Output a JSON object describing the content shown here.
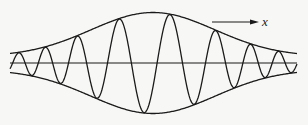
{
  "figure": {
    "title": "",
    "direction_label": "x",
    "colors": {
      "background": "#f7f7f5",
      "ink": "#1a1a1a"
    },
    "axis": {
      "y": 63,
      "x_start": 10,
      "x_end": 297
    },
    "envelope": {
      "center_x": 153,
      "peak_amplitude": 50,
      "edge_amplitude": 6,
      "sigma": 62
    },
    "carrier": {
      "cycles_visible": 12,
      "center_wavelength_px": 52,
      "edge_wavelength_px": 22
    },
    "arrow": {
      "x1": 212,
      "x2": 258,
      "y": 22
    }
  }
}
